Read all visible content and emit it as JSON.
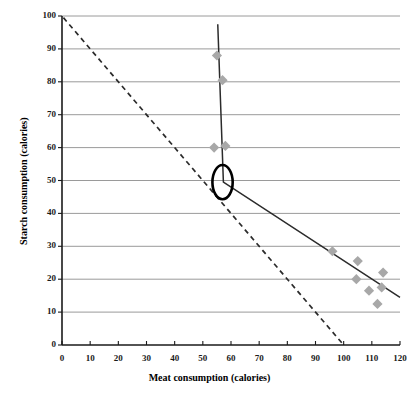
{
  "chart_data": {
    "type": "scatter",
    "title": "",
    "xlabel": "Meat consumption (calories)",
    "ylabel": "Starch consumption (calories)",
    "xlim": [
      0,
      120
    ],
    "ylim": [
      0,
      100
    ],
    "xticks": [
      0,
      10,
      20,
      30,
      40,
      50,
      60,
      70,
      80,
      90,
      100,
      110,
      120
    ],
    "yticks": [
      0,
      10,
      20,
      30,
      40,
      50,
      60,
      70,
      80,
      90,
      100
    ],
    "grid": "horizontal",
    "legend": "none",
    "marker": {
      "shape": "diamond",
      "color": "#a8a8a8",
      "size": 7
    },
    "points": [
      {
        "x": 55,
        "y": 88
      },
      {
        "x": 57,
        "y": 80.5
      },
      {
        "x": 54,
        "y": 60
      },
      {
        "x": 58,
        "y": 60.5
      },
      {
        "x": 96,
        "y": 28.5
      },
      {
        "x": 105,
        "y": 25.5
      },
      {
        "x": 104.5,
        "y": 20
      },
      {
        "x": 109,
        "y": 16.5
      },
      {
        "x": 114,
        "y": 22
      },
      {
        "x": 113.5,
        "y": 17.5
      },
      {
        "x": 112,
        "y": 12.5
      }
    ],
    "series": [
      {
        "name": "price-consumption-curve",
        "style": "solid",
        "color": "#2b2b2b",
        "points": [
          {
            "x": 55.3,
            "y": 97.5
          },
          {
            "x": 57.3,
            "y": 49.5
          },
          {
            "x": 120,
            "y": 14.5
          }
        ]
      },
      {
        "name": "budget-line",
        "style": "dashed",
        "color": "#2b2b2b",
        "points": [
          {
            "x": 0.5,
            "y": 99.5
          },
          {
            "x": 100,
            "y": 0
          }
        ]
      }
    ],
    "annotations": [
      {
        "name": "highlight-oval",
        "shape": "ellipse",
        "cx": 57,
        "cy": 49.5,
        "rx": 3.6,
        "ry": 5.2,
        "stroke": "#000000",
        "stroke_width": 2.6,
        "fill": "none"
      }
    ],
    "colors": {
      "axis": "#1a1a1a",
      "gridline": "#808080",
      "marker": "#a8a8a8",
      "line": "#2b2b2b",
      "annotation": "#000000",
      "background": "#ffffff"
    }
  },
  "axes": {
    "x_title": "Meat consumption (calories)",
    "y_title": "Starch consumption (calories)",
    "x_tick_labels": [
      "0",
      "10",
      "20",
      "30",
      "40",
      "50",
      "60",
      "70",
      "80",
      "90",
      "100",
      "110",
      "120"
    ],
    "y_tick_labels": [
      "0",
      "10",
      "20",
      "30",
      "40",
      "50",
      "60",
      "70",
      "80",
      "90",
      "100"
    ]
  }
}
